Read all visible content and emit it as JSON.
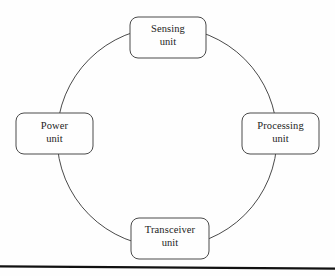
{
  "diagram": {
    "type": "cycle-ring-block-diagram",
    "title": "",
    "background_color": "#fefefe",
    "stroke_color": "#3a3a3a",
    "text_color": "#1c1c1c",
    "ring": {
      "center_x": 167,
      "center_y": 137,
      "radius": 110,
      "stroke_width": 1
    },
    "nodes": [
      {
        "id": "sensing-unit",
        "position": "top",
        "line1": "Sensing",
        "line2": "unit",
        "x": 130,
        "y": 17,
        "width": 76,
        "height": 41,
        "corner_radius": 8
      },
      {
        "id": "processing-unit",
        "position": "right",
        "line1": "Processing",
        "line2": "unit",
        "x": 242,
        "y": 113,
        "width": 77,
        "height": 41,
        "corner_radius": 8
      },
      {
        "id": "transceiver-unit",
        "position": "bottom",
        "line1": "Transceiver",
        "line2": "unit",
        "x": 131,
        "y": 218,
        "width": 78,
        "height": 41,
        "corner_radius": 8
      },
      {
        "id": "power-unit",
        "position": "left",
        "line1": "Power",
        "line2": "unit",
        "x": 16,
        "y": 113,
        "width": 77,
        "height": 41,
        "corner_radius": 8
      }
    ],
    "footer_rule": {
      "color": "#111111",
      "x1": 0,
      "y1": 266.5,
      "x2": 335,
      "y2": 268.5,
      "stroke_width": 2.4
    }
  }
}
